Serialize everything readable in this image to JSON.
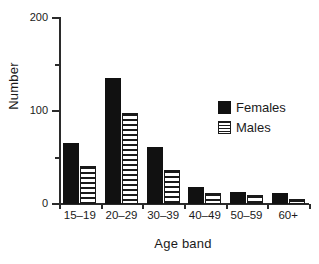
{
  "chart_data": {
    "type": "bar",
    "title": "",
    "subtitle": "",
    "xlabel": "Age band",
    "ylabel": "Number",
    "categories": [
      "15–19",
      "20–29",
      "30–39",
      "40–49",
      "50–59",
      "60+"
    ],
    "series": [
      {
        "name": "Females",
        "values": [
          66,
          135,
          61,
          18,
          13,
          12
        ],
        "fill": "solid-black",
        "color": "#111111"
      },
      {
        "name": "Males",
        "values": [
          41,
          98,
          37,
          12,
          10,
          5
        ],
        "fill": "horizontal-stripes",
        "color": "#1a1a1a"
      }
    ],
    "ylim": [
      0,
      200
    ],
    "yticks": [
      0,
      100,
      200
    ],
    "ytick_labels": [
      "0",
      "100",
      "200"
    ],
    "yticks_minor": [
      50,
      150
    ],
    "grid": false,
    "legend_position": "upper-right-inside",
    "legend_entries": [
      "Females",
      "Males"
    ]
  }
}
